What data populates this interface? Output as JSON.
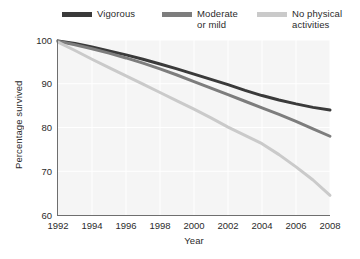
{
  "chart_data": {
    "type": "line",
    "title": "",
    "xlabel": "Year",
    "ylabel": "Percentage survived",
    "xlim": [
      1992,
      2008
    ],
    "ylim": [
      60,
      100
    ],
    "xticks": [
      "1992",
      "1994",
      "1996",
      "1998",
      "2000",
      "2002",
      "2004",
      "2006",
      "2008"
    ],
    "yticks": [
      "60",
      "70",
      "80",
      "90",
      "100"
    ],
    "grid": true,
    "legend_position": "above-plot",
    "x": [
      1992,
      1993,
      1994,
      1995,
      1996,
      1997,
      1998,
      1999,
      2000,
      2001,
      2002,
      2003,
      2004,
      2005,
      2006,
      2007,
      2008
    ],
    "series": [
      {
        "name": "Vigorous",
        "color": "#3a3a3a",
        "values": [
          99.8,
          99.2,
          98.4,
          97.5,
          96.6,
          95.6,
          94.5,
          93.4,
          92.2,
          91.0,
          89.8,
          88.5,
          87.3,
          86.3,
          85.4,
          84.6,
          84.0
        ]
      },
      {
        "name": "Moderate\nor mild",
        "color": "#7d7d7d",
        "values": [
          99.7,
          98.9,
          98.0,
          97.0,
          95.9,
          94.7,
          93.4,
          92.0,
          90.5,
          89.0,
          87.5,
          86.0,
          84.5,
          83.0,
          81.4,
          79.7,
          78.0
        ]
      },
      {
        "name": "No physical\nactivities",
        "color": "#cacaca",
        "values": [
          99.5,
          97.6,
          95.6,
          93.7,
          91.8,
          89.9,
          88.0,
          86.1,
          84.2,
          82.2,
          80.1,
          78.2,
          76.3,
          73.8,
          71.0,
          68.0,
          64.5
        ]
      }
    ]
  }
}
